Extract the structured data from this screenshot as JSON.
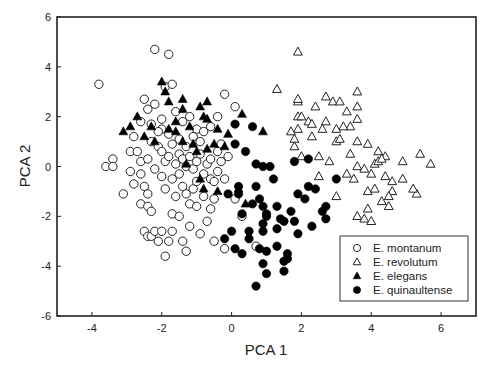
{
  "chart_data": {
    "type": "scatter",
    "title": "",
    "xlabel": "PCA 1",
    "ylabel": "PCA 2",
    "xlim": [
      -5,
      7
    ],
    "ylim": [
      -6,
      6
    ],
    "xticks": [
      -4,
      -2,
      0,
      2,
      4,
      6
    ],
    "yticks": [
      -6,
      -4,
      -2,
      0,
      2,
      4,
      6
    ],
    "grid": false,
    "legend_position": "lower right (inside)",
    "series": [
      {
        "name": "E. montanum",
        "marker": "open-circle",
        "points": [
          [
            -3.8,
            3.3
          ],
          [
            -3.6,
            0.0
          ],
          [
            -3.4,
            0.3
          ],
          [
            -3.4,
            0.0
          ],
          [
            -3.1,
            -1.1
          ],
          [
            -2.9,
            0.6
          ],
          [
            -2.8,
            -0.7
          ],
          [
            -2.6,
            -1.5
          ],
          [
            -2.5,
            -2.6
          ],
          [
            -2.4,
            -2.8
          ],
          [
            -2.3,
            -2.8
          ],
          [
            -2.9,
            -0.2
          ],
          [
            -2.8,
            1.2
          ],
          [
            -2.7,
            0.6
          ],
          [
            -2.6,
            0.2
          ],
          [
            -2.6,
            -0.3
          ],
          [
            -2.5,
            -0.8
          ],
          [
            -2.4,
            -1.1
          ],
          [
            -2.4,
            -1.6
          ],
          [
            -2.3,
            -1.8
          ],
          [
            -2.2,
            -2.6
          ],
          [
            -2.1,
            -3.0
          ],
          [
            -2.0,
            -2.6
          ],
          [
            -1.9,
            -3.6
          ],
          [
            -1.8,
            -3.0
          ],
          [
            -1.7,
            -2.6
          ],
          [
            -1.7,
            -1.9
          ],
          [
            -1.6,
            -1.2
          ],
          [
            -1.5,
            -2.0
          ],
          [
            -1.4,
            -3.0
          ],
          [
            -1.3,
            -3.4
          ],
          [
            -1.2,
            -2.4
          ],
          [
            -1.2,
            -1.5
          ],
          [
            -1.1,
            -0.9
          ],
          [
            -1.0,
            -0.6
          ],
          [
            -1.0,
            -1.6
          ],
          [
            -0.9,
            -2.7
          ],
          [
            -0.8,
            -1.2
          ],
          [
            -0.7,
            -2.2
          ],
          [
            -0.6,
            -0.5
          ],
          [
            -0.6,
            -1.7
          ],
          [
            -0.5,
            -3.0
          ],
          [
            -0.5,
            -1.3
          ],
          [
            -0.4,
            -0.2
          ],
          [
            -0.3,
            0.2
          ],
          [
            -0.3,
            0.9
          ],
          [
            -0.2,
            -0.5
          ],
          [
            -0.1,
            0.4
          ],
          [
            0.1,
            -1.3
          ],
          [
            0.3,
            -2.0
          ],
          [
            0.7,
            -3.2
          ],
          [
            -0.2,
            -3.3
          ],
          [
            -0.5,
            -0.6
          ],
          [
            -2.2,
            4.7
          ],
          [
            -1.8,
            4.5
          ],
          [
            -1.0,
            1.5
          ],
          [
            -1.9,
            3.2
          ],
          [
            -1.7,
            3.3
          ],
          [
            -2.5,
            2.7
          ],
          [
            -2.4,
            2.3
          ],
          [
            -2.2,
            2.5
          ],
          [
            -2.0,
            1.9
          ],
          [
            -2.0,
            1.5
          ],
          [
            -1.8,
            1.3
          ],
          [
            -1.7,
            0.9
          ],
          [
            -1.5,
            1.1
          ],
          [
            -1.3,
            0.8
          ],
          [
            -1.1,
            1.2
          ],
          [
            -0.9,
            1.0
          ],
          [
            -0.8,
            1.4
          ],
          [
            -0.6,
            1.6
          ],
          [
            -2.3,
            1.0
          ],
          [
            -2.1,
            0.8
          ],
          [
            -2.0,
            0.6
          ],
          [
            -1.9,
            0.2
          ],
          [
            -1.8,
            0.4
          ],
          [
            -1.6,
            0.1
          ],
          [
            -1.5,
            0.5
          ],
          [
            -1.4,
            0.3
          ],
          [
            -1.3,
            0.0
          ],
          [
            -1.2,
            0.4
          ],
          [
            -1.1,
            -0.1
          ],
          [
            -1.0,
            0.2
          ],
          [
            -0.9,
            0.5
          ],
          [
            -0.8,
            -0.3
          ],
          [
            -0.7,
            0.1
          ],
          [
            -0.6,
            0.3
          ],
          [
            -0.4,
            0.6
          ],
          [
            -2.6,
            1.8
          ],
          [
            -2.3,
            1.7
          ],
          [
            -2.1,
            1.4
          ],
          [
            -1.6,
            2.2
          ],
          [
            -1.4,
            1.8
          ],
          [
            -1.2,
            2.0
          ],
          [
            -0.2,
            2.9
          ],
          [
            -0.4,
            2.0
          ],
          [
            0.1,
            2.4
          ],
          [
            -2.4,
            0.3
          ],
          [
            -2.2,
            -0.1
          ],
          [
            -2.0,
            -0.4
          ],
          [
            -1.9,
            -0.9
          ],
          [
            -1.7,
            -0.5
          ],
          [
            -1.5,
            -0.3
          ],
          [
            -1.4,
            -0.8
          ],
          [
            -1.3,
            -1.1
          ]
        ]
      },
      {
        "name": "E. revolutum",
        "marker": "open-triangle",
        "points": [
          [
            1.9,
            4.6
          ],
          [
            1.3,
            3.1
          ],
          [
            1.9,
            2.6
          ],
          [
            1.9,
            2.7
          ],
          [
            2.7,
            2.8
          ],
          [
            2.4,
            2.4
          ],
          [
            2.9,
            2.6
          ],
          [
            3.6,
            3.0
          ],
          [
            3.1,
            2.6
          ],
          [
            3.6,
            2.4
          ],
          [
            3.6,
            1.9
          ],
          [
            3.4,
            1.6
          ],
          [
            3.3,
            2.2
          ],
          [
            3.2,
            1.6
          ],
          [
            3.0,
            1.5
          ],
          [
            2.7,
            1.8
          ],
          [
            2.6,
            1.5
          ],
          [
            2.3,
            1.2
          ],
          [
            1.9,
            2.0
          ],
          [
            2.0,
            2.0
          ],
          [
            2.2,
            1.8
          ],
          [
            2.3,
            1.7
          ],
          [
            1.9,
            1.5
          ],
          [
            1.8,
            1.1
          ],
          [
            1.8,
            0.8
          ],
          [
            2.0,
            0.4
          ],
          [
            2.5,
            0.4
          ],
          [
            1.7,
            1.4
          ],
          [
            3.0,
            1.0
          ],
          [
            3.1,
            1.1
          ],
          [
            3.4,
            0.5
          ],
          [
            3.6,
            1.0
          ],
          [
            3.9,
            0.9
          ],
          [
            4.2,
            0.6
          ],
          [
            4.4,
            0.4
          ],
          [
            4.1,
            0.1
          ],
          [
            3.6,
            0.0
          ],
          [
            3.3,
            -0.3
          ],
          [
            3.5,
            -0.5
          ],
          [
            3.8,
            -0.1
          ],
          [
            4.0,
            -0.3
          ],
          [
            4.2,
            0.2
          ],
          [
            4.3,
            0.3
          ],
          [
            4.4,
            -0.4
          ],
          [
            4.6,
            -0.6
          ],
          [
            4.9,
            -0.5
          ],
          [
            4.6,
            -1.0
          ],
          [
            4.3,
            -1.4
          ],
          [
            4.5,
            -1.6
          ],
          [
            3.9,
            -1.0
          ],
          [
            5.4,
            0.5
          ],
          [
            5.7,
            0.1
          ],
          [
            5.3,
            -1.1
          ],
          [
            5.2,
            -0.9
          ],
          [
            3.6,
            -2.0
          ],
          [
            3.9,
            -1.7
          ],
          [
            3.8,
            -2.1
          ],
          [
            4.0,
            -2.2
          ],
          [
            2.8,
            0.2
          ],
          [
            2.5,
            -0.4
          ],
          [
            4.5,
            -1.2
          ],
          [
            3.0,
            -1.2
          ],
          [
            4.9,
            0.2
          ],
          [
            4.1,
            -0.9
          ]
        ]
      },
      {
        "name": "E. elegans",
        "marker": "filled-triangle",
        "points": [
          [
            -2.0,
            3.4
          ],
          [
            -1.9,
            3.0
          ],
          [
            -1.8,
            2.6
          ],
          [
            -1.4,
            2.7
          ],
          [
            -1.4,
            2.3
          ],
          [
            -0.9,
            2.4
          ],
          [
            -0.7,
            2.6
          ],
          [
            -0.8,
            2.0
          ],
          [
            -0.4,
            1.5
          ],
          [
            -1.6,
            1.4
          ],
          [
            -1.4,
            1.0
          ],
          [
            -1.1,
            0.9
          ],
          [
            -0.7,
            0.7
          ],
          [
            -3.1,
            1.4
          ],
          [
            -2.9,
            1.6
          ],
          [
            -2.3,
            1.6
          ],
          [
            -1.8,
            1.5
          ],
          [
            -1.6,
            1.8
          ],
          [
            -1.2,
            1.6
          ],
          [
            -0.1,
            1.3
          ],
          [
            -0.8,
            -0.9
          ],
          [
            -0.4,
            -1.0
          ],
          [
            -0.2,
            0.8
          ],
          [
            0.2,
            -0.9
          ],
          [
            0.4,
            -1.5
          ],
          [
            -0.9,
            -0.5
          ],
          [
            0.3,
            2.1
          ],
          [
            -0.7,
            1.9
          ],
          [
            -2.2,
            1.0
          ],
          [
            -2.5,
            1.2
          ],
          [
            -2.7,
            2.0
          ],
          [
            0.9,
            1.4
          ],
          [
            -0.5,
            0.9
          ],
          [
            -1.0,
            0.6
          ],
          [
            -1.3,
            0.1
          ]
        ]
      },
      {
        "name": "E. quinaultense",
        "marker": "filled-circle",
        "points": [
          [
            0.1,
            1.7
          ],
          [
            0.6,
            1.6
          ],
          [
            0.1,
            0.9
          ],
          [
            0.7,
            0.1
          ],
          [
            0.9,
            0.0
          ],
          [
            1.1,
            0.0
          ],
          [
            0.7,
            -0.8
          ],
          [
            0.2,
            -0.8
          ],
          [
            0.2,
            -1.1
          ],
          [
            0.6,
            -1.5
          ],
          [
            0.9,
            -1.6
          ],
          [
            1.0,
            -1.9
          ],
          [
            1.3,
            -1.6
          ],
          [
            1.4,
            -2.1
          ],
          [
            1.7,
            -1.8
          ],
          [
            1.9,
            -1.1
          ],
          [
            2.2,
            -0.8
          ],
          [
            2.4,
            -0.9
          ],
          [
            2.6,
            -1.8
          ],
          [
            2.7,
            -2.1
          ],
          [
            2.3,
            -2.4
          ],
          [
            1.8,
            -2.2
          ],
          [
            1.5,
            -2.2
          ],
          [
            0.9,
            -2.3
          ],
          [
            0.5,
            -2.6
          ],
          [
            0.5,
            -2.9
          ],
          [
            0.3,
            -3.5
          ],
          [
            0.8,
            -3.3
          ],
          [
            1.0,
            -3.4
          ],
          [
            1.3,
            -3.2
          ],
          [
            1.5,
            -3.8
          ],
          [
            1.6,
            -3.5
          ],
          [
            1.5,
            -4.2
          ],
          [
            0.9,
            -3.9
          ],
          [
            1.0,
            -4.3
          ],
          [
            0.7,
            -4.8
          ],
          [
            1.6,
            -3.7
          ],
          [
            1.9,
            -2.7
          ],
          [
            2.2,
            0.3
          ],
          [
            3.0,
            -0.5
          ],
          [
            1.0,
            -2.0
          ],
          [
            0.9,
            -2.6
          ],
          [
            0.3,
            -1.9
          ],
          [
            0.0,
            -2.6
          ],
          [
            -0.2,
            -2.9
          ],
          [
            1.3,
            -2.5
          ],
          [
            1.8,
            0.2
          ],
          [
            0.8,
            -1.3
          ],
          [
            2.1,
            -1.3
          ],
          [
            1.2,
            -0.5
          ],
          [
            -0.1,
            -1.1
          ],
          [
            0.4,
            0.6
          ],
          [
            2.7,
            -1.6
          ],
          [
            0.1,
            -3.3
          ]
        ]
      }
    ]
  },
  "legend": {
    "items": [
      {
        "label": "E. montanum",
        "marker": "open-circle"
      },
      {
        "label": "E. revolutum",
        "marker": "open-triangle"
      },
      {
        "label": "E. elegans",
        "marker": "filled-triangle"
      },
      {
        "label": "E. quinaultense",
        "marker": "filled-circle"
      }
    ]
  },
  "axes": {
    "x_title": "PCA 1",
    "y_title": "PCA 2"
  }
}
